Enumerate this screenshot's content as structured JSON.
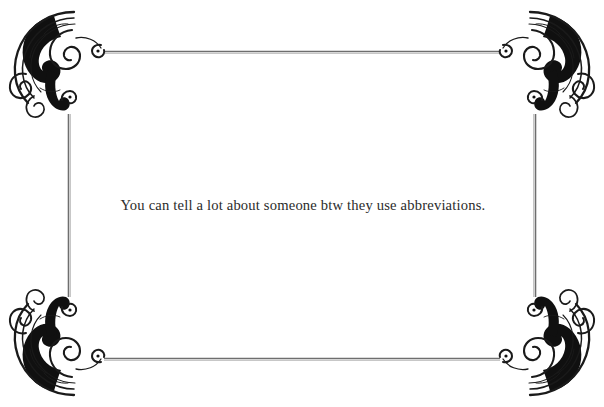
{
  "page": {
    "width": 604,
    "height": 407,
    "background_color": "#ffffff",
    "kind": "decorative-quote-card"
  },
  "quote": {
    "text": "You can tell a lot about someone btw they use abbreviations.",
    "color": "#2b2b2b",
    "align": "center"
  },
  "frame": {
    "line_color": "#6e6e6e",
    "ornament_color": "#1a1a1a",
    "style": "victorian-filigree-border",
    "top_y": 52,
    "bottom_y": 359,
    "left_x": 69,
    "right_x": 535,
    "corners": [
      {
        "name": "ornament-top-left",
        "position": "top-left"
      },
      {
        "name": "ornament-top-right",
        "position": "top-right"
      },
      {
        "name": "ornament-bottom-left",
        "position": "bottom-left"
      },
      {
        "name": "ornament-bottom-right",
        "position": "bottom-right"
      }
    ]
  }
}
